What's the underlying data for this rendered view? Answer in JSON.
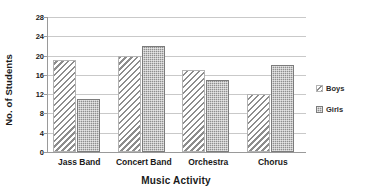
{
  "chart_data": {
    "type": "bar",
    "title": "",
    "categories": [
      "Jass Band",
      "Concert Band",
      "Orchestra",
      "Chorus"
    ],
    "series": [
      {
        "name": "Boys",
        "values": [
          19,
          20,
          17,
          12
        ],
        "pattern": "diagonal-hatch",
        "color": "#8d8d8d"
      },
      {
        "name": "Girls",
        "values": [
          11,
          22,
          15,
          18
        ],
        "pattern": "dotted-fill",
        "color": "#8f8f8f"
      }
    ],
    "xlabel": "Music Activity",
    "ylabel": "No. of Students",
    "ylim": [
      0,
      28
    ],
    "ytick_step": 4,
    "yticks": [
      28,
      24,
      20,
      16,
      12,
      8,
      4,
      0
    ],
    "grid": "horizontal",
    "legend_position": "right",
    "background_color": "#ffffff",
    "gridline_color": "#c9c9c9",
    "axis_color": "#9a9a9a"
  },
  "axes": {
    "y_title": "No. of Students",
    "x_title": "Music Activity",
    "y_ticks": [
      "28",
      "24",
      "20",
      "16",
      "12",
      "8",
      "4",
      "0"
    ],
    "x_ticks": [
      "Jass Band",
      "Concert Band",
      "Orchestra",
      "Chorus"
    ]
  },
  "legend": {
    "items": [
      {
        "label": "Boys",
        "swatch": "diagonal-hatch-swatch"
      },
      {
        "label": "Girls",
        "swatch": "dotted-fill-swatch"
      }
    ]
  }
}
